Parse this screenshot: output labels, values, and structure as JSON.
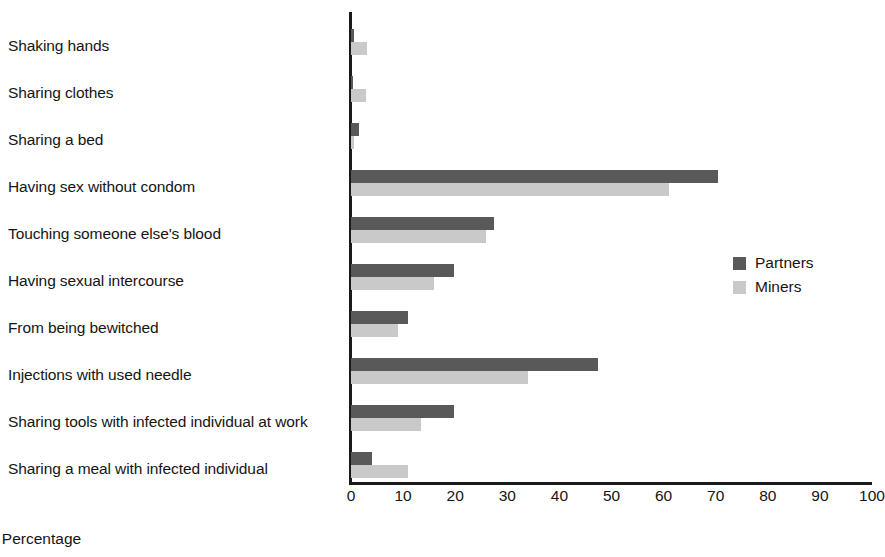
{
  "chart_data": {
    "type": "bar",
    "orientation": "horizontal",
    "title": "",
    "xlabel": "Percentage",
    "ylabel": "",
    "xlim": [
      0,
      100
    ],
    "xticks": [
      0,
      10,
      20,
      30,
      40,
      50,
      60,
      70,
      80,
      90,
      100
    ],
    "grid": false,
    "legend_position": "right",
    "categories": [
      "Shaking hands",
      "Sharing clothes",
      "Sharing a bed",
      "Having sex without condom",
      "Touching someone else's blood",
      "Having sexual intercourse",
      "From being bewitched",
      "Injections with used needle",
      "Sharing tools with infected individual at work",
      "Sharing a meal with infected individual"
    ],
    "series": [
      {
        "name": "Partners",
        "color": "#59595b",
        "values": [
          0.5,
          0.4,
          1.6,
          70.5,
          27.5,
          19.8,
          11.0,
          47.5,
          19.8,
          4.0
        ]
      },
      {
        "name": "Miners",
        "color": "#c9c9c9",
        "values": [
          3.0,
          2.8,
          0.6,
          61.0,
          26.0,
          16.0,
          9.0,
          34.0,
          13.5,
          11.0
        ]
      }
    ]
  }
}
